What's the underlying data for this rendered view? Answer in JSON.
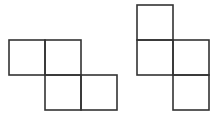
{
  "diagram": {
    "stroke_color": "#333333",
    "background": "#ffffff",
    "unit": 36,
    "shapes": [
      {
        "name": "shape-left",
        "squares": [
          {
            "x": 9,
            "y": 40
          },
          {
            "x": 45,
            "y": 40
          },
          {
            "x": 45,
            "y": 75
          },
          {
            "x": 81,
            "y": 75
          }
        ]
      },
      {
        "name": "shape-right",
        "squares": [
          {
            "x": 137,
            "y": 5
          },
          {
            "x": 137,
            "y": 40
          },
          {
            "x": 173,
            "y": 40
          },
          {
            "x": 173,
            "y": 75
          }
        ]
      }
    ]
  }
}
